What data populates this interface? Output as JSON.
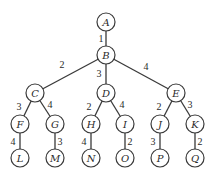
{
  "diagram": {
    "type": "weighted-tree",
    "node_radius": 9,
    "nodes": [
      {
        "id": "A",
        "label": "A",
        "x": 106,
        "y": 22
      },
      {
        "id": "B",
        "label": "B",
        "x": 106,
        "y": 55
      },
      {
        "id": "C",
        "label": "C",
        "x": 35,
        "y": 93
      },
      {
        "id": "D",
        "label": "D",
        "x": 106,
        "y": 93
      },
      {
        "id": "E",
        "label": "E",
        "x": 176,
        "y": 93
      },
      {
        "id": "F",
        "label": "F",
        "x": 20,
        "y": 124
      },
      {
        "id": "G",
        "label": "G",
        "x": 55,
        "y": 124
      },
      {
        "id": "H",
        "label": "H",
        "x": 91,
        "y": 124
      },
      {
        "id": "I",
        "label": "I",
        "x": 125,
        "y": 124
      },
      {
        "id": "J",
        "label": "J",
        "x": 160,
        "y": 124
      },
      {
        "id": "K",
        "label": "K",
        "x": 195,
        "y": 124
      },
      {
        "id": "L",
        "label": "L",
        "x": 20,
        "y": 158
      },
      {
        "id": "M",
        "label": "M",
        "x": 55,
        "y": 158
      },
      {
        "id": "N",
        "label": "N",
        "x": 91,
        "y": 158
      },
      {
        "id": "O",
        "label": "O",
        "x": 125,
        "y": 158
      },
      {
        "id": "P",
        "label": "P",
        "x": 160,
        "y": 158
      },
      {
        "id": "Q",
        "label": "Q",
        "x": 195,
        "y": 158
      }
    ],
    "edges": [
      {
        "from": "A",
        "to": "B",
        "weight": "1",
        "lx": 101,
        "ly": 42
      },
      {
        "from": "B",
        "to": "C",
        "weight": "2",
        "lx": 62,
        "ly": 68
      },
      {
        "from": "B",
        "to": "D",
        "weight": "3",
        "lx": 99,
        "ly": 77
      },
      {
        "from": "B",
        "to": "E",
        "weight": "4",
        "lx": 146,
        "ly": 70
      },
      {
        "from": "C",
        "to": "F",
        "weight": "3",
        "lx": 19,
        "ly": 110
      },
      {
        "from": "C",
        "to": "G",
        "weight": "4",
        "lx": 50,
        "ly": 108
      },
      {
        "from": "D",
        "to": "H",
        "weight": "2",
        "lx": 89,
        "ly": 110
      },
      {
        "from": "D",
        "to": "I",
        "weight": "4",
        "lx": 122,
        "ly": 108
      },
      {
        "from": "E",
        "to": "J",
        "weight": "2",
        "lx": 159,
        "ly": 110
      },
      {
        "from": "E",
        "to": "K",
        "weight": "3",
        "lx": 190,
        "ly": 108
      },
      {
        "from": "F",
        "to": "L",
        "weight": "4",
        "lx": 13,
        "ly": 145
      },
      {
        "from": "G",
        "to": "M",
        "weight": "3",
        "lx": 60,
        "ly": 145
      },
      {
        "from": "H",
        "to": "N",
        "weight": "4",
        "lx": 84,
        "ly": 145
      },
      {
        "from": "I",
        "to": "O",
        "weight": "2",
        "lx": 130,
        "ly": 145
      },
      {
        "from": "J",
        "to": "P",
        "weight": "3",
        "lx": 153,
        "ly": 145
      },
      {
        "from": "K",
        "to": "Q",
        "weight": "2",
        "lx": 200,
        "ly": 145
      }
    ]
  }
}
